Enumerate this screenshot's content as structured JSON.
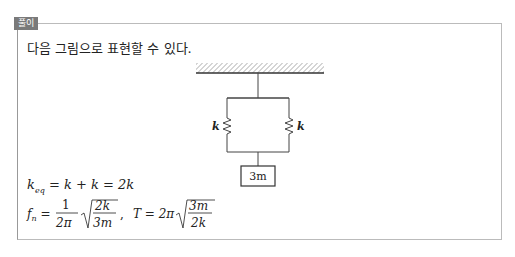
{
  "header": {
    "tag_label": "풀이"
  },
  "content": {
    "intro": "다음 그림으로 표현할 수 있다.",
    "diagram": {
      "spring_left_label": "k",
      "spring_right_label": "k",
      "mass_label": "3m"
    },
    "equations": {
      "keq": "k_eq = k + k = 2k",
      "fn": "f_n = 1/(2π) √(2k/3m)",
      "T": "T = 2π √(3m/2k)"
    }
  }
}
